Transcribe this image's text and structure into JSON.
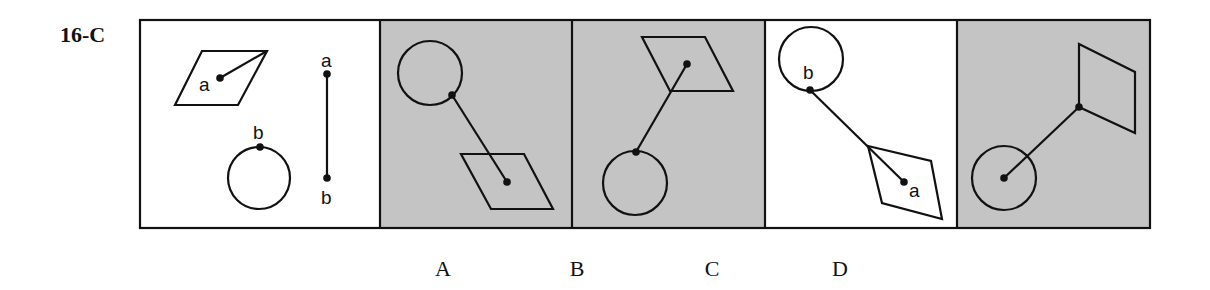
{
  "problem": {
    "label": "16-C"
  },
  "colors": {
    "panel_gray": "#c4c4c4",
    "panel_white": "#ffffff",
    "stroke": "#111111"
  },
  "stem": {
    "labels": {
      "shape_point": "a",
      "circle_point": "b",
      "segment_top": "a",
      "segment_bottom": "b"
    }
  },
  "choices": [
    {
      "letter": "A",
      "shaded": true
    },
    {
      "letter": "B",
      "shaded": true
    },
    {
      "letter": "C",
      "shaded": false,
      "labels": {
        "circle_point": "b",
        "shape_point": "a"
      }
    },
    {
      "letter": "D",
      "shaded": true
    }
  ]
}
